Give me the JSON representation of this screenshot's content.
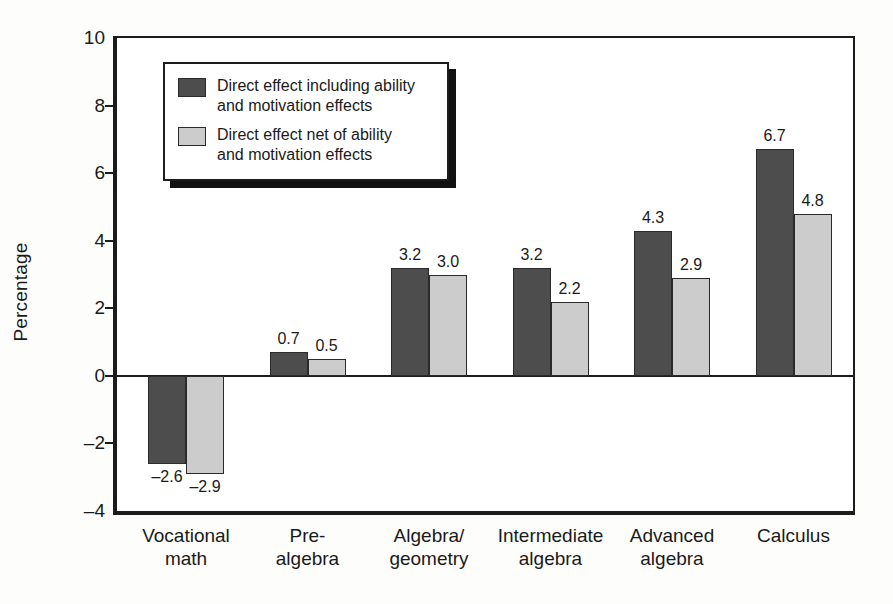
{
  "chart_data": {
    "type": "bar",
    "title": "",
    "subtitle": "",
    "xlabel": "",
    "ylabel": "Percentage",
    "ylim": [
      -4,
      10
    ],
    "yticks": [
      10,
      8,
      6,
      4,
      2,
      0,
      -2,
      -4
    ],
    "ytick_labels": [
      "10",
      "8",
      "6",
      "4",
      "2",
      "0",
      "–2",
      "–4"
    ],
    "grid": false,
    "legend_position": "upper-left-inside",
    "categories": [
      "Vocational\nmath",
      "Pre-\nalgebra",
      "Algebra/\ngeometry",
      "Intermediate\nalgebra",
      "Advanced\nalgebra",
      "Calculus"
    ],
    "category_lines": [
      [
        "Vocational",
        "math"
      ],
      [
        "Pre-",
        "algebra"
      ],
      [
        "Algebra/",
        "geometry"
      ],
      [
        "Intermediate",
        "algebra"
      ],
      [
        "Advanced",
        "algebra"
      ],
      [
        "Calculus",
        ""
      ]
    ],
    "series": [
      {
        "name": "Direct effect including ability and motivation effects",
        "legend_lines": [
          "Direct effect including ability",
          "and motivation effects"
        ],
        "color": "#4d4d4d",
        "values": [
          -2.6,
          0.7,
          3.2,
          3.2,
          4.3,
          6.7
        ],
        "labels": [
          "–2.6",
          "0.7",
          "3.2",
          "3.2",
          "4.3",
          "6.7"
        ]
      },
      {
        "name": "Direct effect net of ability and motivation effects",
        "legend_lines": [
          "Direct effect net of ability",
          "and motivation effects"
        ],
        "color": "#cccccc",
        "values": [
          -2.9,
          0.5,
          3.0,
          2.2,
          2.9,
          4.8
        ],
        "labels": [
          "–2.9",
          "0.5",
          "3.0",
          "2.2",
          "2.9",
          "4.8"
        ]
      }
    ]
  },
  "colors": {
    "series_dark": "#4d4d4d",
    "series_light": "#cccccc",
    "axis": "#1c1c1c",
    "text": "#1a1a1a",
    "background": "#ffffff"
  }
}
